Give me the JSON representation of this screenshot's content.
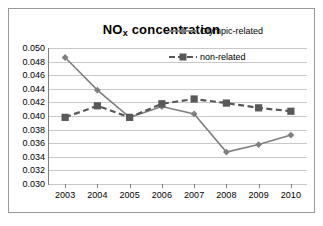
{
  "chart_data": {
    "type": "line",
    "title": "NOx concentration",
    "title_parts": {
      "base": "NO",
      "subscript": "x",
      "rest": " concentration"
    },
    "xlabel": "",
    "ylabel": "",
    "categories": [
      "2003",
      "2004",
      "2005",
      "2006",
      "2007",
      "2008",
      "2009",
      "2010"
    ],
    "series": [
      {
        "name": "Olympic-related",
        "values": [
          0.0486,
          0.0438,
          0.0398,
          0.0414,
          0.0403,
          0.0347,
          0.0358,
          0.0372
        ],
        "line_style": "solid",
        "marker": "diamond",
        "color": "#7f7f7f"
      },
      {
        "name": "non-related",
        "values": [
          0.0398,
          0.0415,
          0.0398,
          0.0418,
          0.0425,
          0.0419,
          0.0412,
          0.0407
        ],
        "line_style": "dashed",
        "marker": "square",
        "color": "#595959"
      }
    ],
    "ylim": [
      0.03,
      0.05
    ],
    "ytick_step": 0.002,
    "ytick_labels": [
      "0.050",
      "0.048",
      "0.046",
      "0.044",
      "0.042",
      "0.040",
      "0.038",
      "0.036",
      "0.034",
      "0.032",
      "0.030"
    ],
    "grid": true,
    "legend_position": "inside-top-right"
  },
  "colors": {
    "frame_border": "#9a9a9a",
    "gridline": "#c9c9c9",
    "axis": "#808080",
    "text": "#000000",
    "background": "#ffffff"
  }
}
